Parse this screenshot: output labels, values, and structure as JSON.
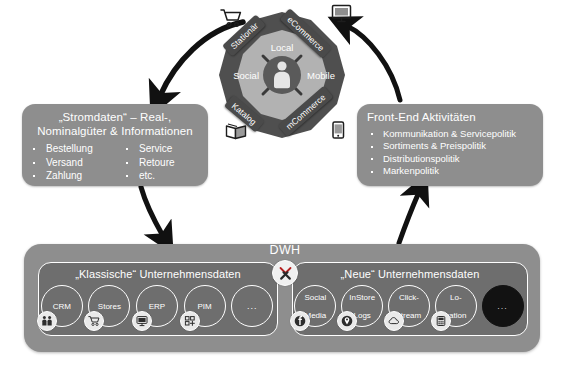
{
  "diagram": {
    "title_hidden": "",
    "colors": {
      "panel_grey": "#8e8e8e",
      "group_grey": "#6e6e6e",
      "wheel_outer": "#4a4a4a",
      "wheel_inner": "#a8a8a8",
      "tag_dark": "#4a4a4a",
      "white": "#ffffff",
      "arrow_black": "#1a1a1a"
    }
  },
  "wheel": {
    "name": "customer-channel-wheel",
    "center_icon": "person-icon",
    "outer_labels": [
      {
        "label": "Stationär",
        "icon": "shopping-cart-icon"
      },
      {
        "label": "eCommerce",
        "icon": "desktop-computer-icon"
      },
      {
        "label": "mCommerce",
        "icon": "mobile-phone-icon"
      },
      {
        "label": "Katalog",
        "icon": "catalog-book-icon"
      }
    ],
    "inner_labels": [
      "Local",
      "Mobile",
      "Social"
    ]
  },
  "left_panel": {
    "title": "„Stromdaten“ – Real-,\nNominalgüter & Informationen",
    "title_line1": "„Stromdaten“ – Real-,",
    "title_line2": "Nominalgüter & Informationen",
    "bullets_col1": [
      "Bestellung",
      "Versand",
      "Zahlung"
    ],
    "bullets_col2": [
      "Service",
      "Retoure",
      "etc."
    ]
  },
  "right_panel": {
    "title": "Front-End Aktivitäten",
    "bullets": [
      "Kommunikation & Servicepolitik",
      "Sortiments & Preispolitik",
      "Distributionspolitik",
      "Markenpolitik"
    ]
  },
  "dwh": {
    "label": "DWH",
    "tool_icon": "tools-wrench-screwdriver-icon",
    "groups": [
      {
        "title": "„Klassische“ Unternehmensdaten",
        "nodes": [
          {
            "label": "CRM",
            "label_line2": "",
            "icon": "people-icon"
          },
          {
            "label": "Stores",
            "label_line2": "",
            "icon": "shopping-cart-icon"
          },
          {
            "label": "ERP",
            "label_line2": "",
            "icon": "desktop-computer-icon"
          },
          {
            "label": "PIM",
            "label_line2": "",
            "icon": "grid-blocks-icon"
          },
          {
            "label": "...",
            "label_line2": "",
            "icon": ""
          }
        ]
      },
      {
        "title": "„Neue“ Unternehmensdaten",
        "nodes": [
          {
            "label": "Social",
            "label_line2": "Media",
            "icon": "facebook-f-icon"
          },
          {
            "label": "InStore",
            "label_line2": "Logs",
            "icon": "location-pin-icon"
          },
          {
            "label": "Click-",
            "label_line2": "stream",
            "icon": "cloud-icon"
          },
          {
            "label": "Lo-",
            "label_line2": "cation",
            "icon": "device-grid-icon"
          },
          {
            "label": "...",
            "label_line2": "",
            "icon": ""
          }
        ]
      }
    ]
  },
  "arrows": [
    {
      "name": "wheel-to-left-panel",
      "direction": "down-left"
    },
    {
      "name": "right-panel-to-wheel",
      "direction": "up-left"
    },
    {
      "name": "left-panel-to-dwh",
      "direction": "down-right"
    },
    {
      "name": "dwh-to-right-panel",
      "direction": "up-right"
    }
  ]
}
